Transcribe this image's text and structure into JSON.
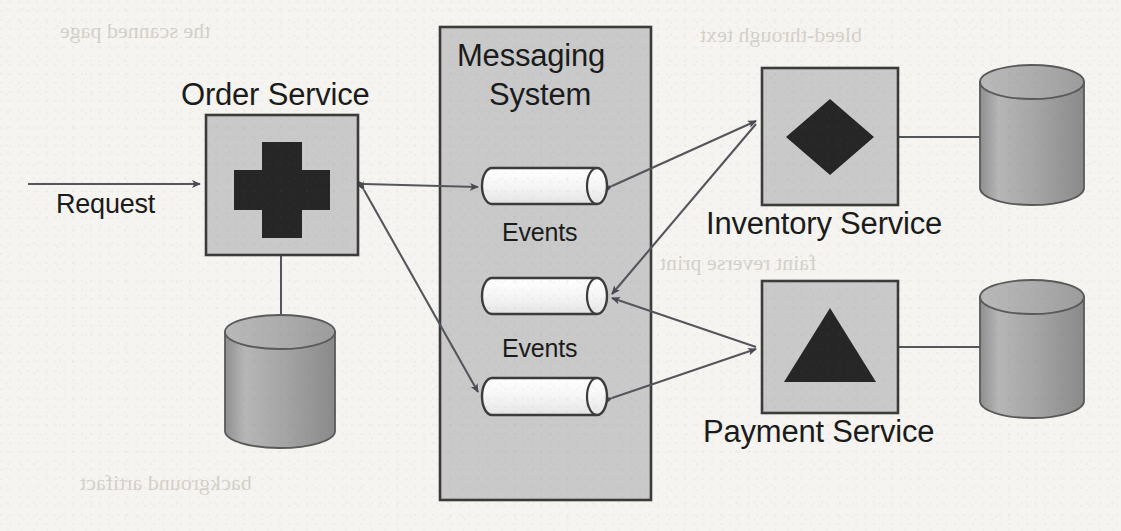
{
  "diagram": {
    "background_color": "#f6f4f0",
    "box_fill": "#c9c9c9",
    "box_stroke": "#3b3b3b",
    "icon_fill": "#262626",
    "cylinder_fill": "#a8a8a8",
    "queue_fill": "#f2f2f2",
    "line_color": "#55555c"
  },
  "labels": {
    "request": "Request",
    "order_service": "Order Service",
    "messaging_system_line1": "Messaging",
    "messaging_system_line2": "System",
    "events_top": "Events",
    "events_bottom": "Events",
    "inventory_service": "Inventory Service",
    "payment_service": "Payment Service"
  },
  "nodes": [
    {
      "id": "order-service",
      "label": "Order Service",
      "icon": "cross-icon",
      "x": 206,
      "y": 115,
      "w": 152,
      "h": 140
    },
    {
      "id": "messaging-system",
      "label": "Messaging System",
      "x": 440,
      "y": 27,
      "w": 211,
      "h": 473
    },
    {
      "id": "inventory-service",
      "label": "Inventory Service",
      "icon": "diamond-icon",
      "x": 762,
      "y": 68,
      "w": 136,
      "h": 137
    },
    {
      "id": "payment-service",
      "label": "Payment Service",
      "icon": "triangle-icon",
      "x": 762,
      "y": 281,
      "w": 136,
      "h": 132
    }
  ],
  "queues": [
    {
      "id": "queue-1",
      "label": "Events",
      "x": 484,
      "y": 168,
      "w": 121,
      "h": 36
    },
    {
      "id": "queue-2",
      "label": "Events",
      "x": 484,
      "y": 278,
      "w": 121,
      "h": 36
    },
    {
      "id": "queue-3",
      "label": "",
      "x": 484,
      "y": 378,
      "w": 121,
      "h": 37
    }
  ],
  "databases": [
    {
      "id": "order-database",
      "x": 225,
      "y": 315,
      "w": 110,
      "h": 133
    },
    {
      "id": "inventory-database",
      "x": 980,
      "y": 65,
      "w": 105,
      "h": 140
    },
    {
      "id": "payment-database",
      "x": 980,
      "y": 280,
      "w": 105,
      "h": 138
    }
  ],
  "connections": [
    {
      "id": "request-to-order",
      "from": "request",
      "to": "order-service",
      "arrow": "end"
    },
    {
      "id": "order-to-database",
      "from": "order-service",
      "to": "order-database",
      "arrow": "none"
    },
    {
      "id": "order-to-queue-1",
      "from": "order-service",
      "to": "queue-1",
      "arrow": "both"
    },
    {
      "id": "order-to-queue-3",
      "from": "order-service",
      "to": "queue-3",
      "arrow": "both"
    },
    {
      "id": "queue-1-to-inventory",
      "from": "queue-1",
      "to": "inventory-service",
      "arrow": "both"
    },
    {
      "id": "inventory-to-queue-2",
      "from": "inventory-service",
      "to": "queue-2",
      "arrow": "end"
    },
    {
      "id": "payment-to-queue-2",
      "from": "payment-service",
      "to": "queue-2",
      "arrow": "end"
    },
    {
      "id": "queue-3-to-payment",
      "from": "queue-3",
      "to": "payment-service",
      "arrow": "both"
    },
    {
      "id": "inventory-to-database",
      "from": "inventory-service",
      "to": "inventory-database",
      "arrow": "none"
    },
    {
      "id": "payment-to-database",
      "from": "payment-service",
      "to": "payment-database",
      "arrow": "none"
    }
  ],
  "ghost_text": {
    "g1": "the scanned page",
    "g2": "bleed-through text",
    "g3": "faint reverse print",
    "g4": "background artifact"
  }
}
